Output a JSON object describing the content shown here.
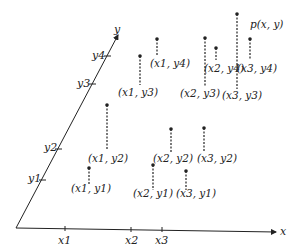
{
  "diagram": {
    "axes": {
      "x_label": "x",
      "y_label": "y",
      "x_ticks": [
        "x1",
        "x2",
        "x3"
      ],
      "y_ticks": [
        "y1",
        "y2",
        "y3",
        "y4"
      ]
    },
    "function_label": "p(x, y)",
    "points": [
      {
        "label": "(x1, y4)"
      },
      {
        "label": "(x1, y3)"
      },
      {
        "label": "(x2, y4)"
      },
      {
        "label": "(x2, y3)"
      },
      {
        "label": "(x3, y4)"
      },
      {
        "label": "(x3, y3)"
      },
      {
        "label": "(x1, y2)"
      },
      {
        "label": "(x1, y1)"
      },
      {
        "label": "(x2, y2)"
      },
      {
        "label": "(x2, y1)"
      },
      {
        "label": "(x3, y2)"
      },
      {
        "label": "(x3, y1)"
      }
    ]
  }
}
